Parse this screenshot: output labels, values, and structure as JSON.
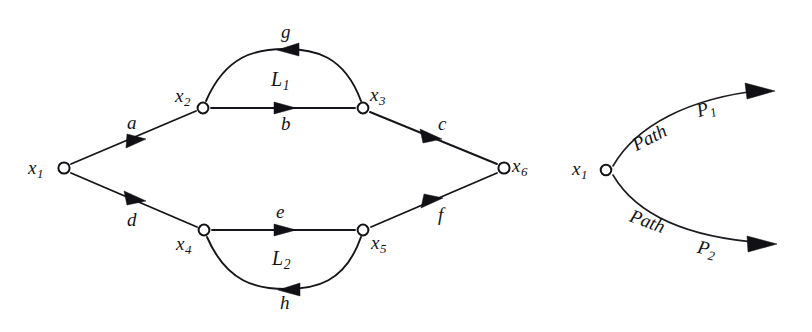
{
  "figure": {
    "background_color": "#ffffff",
    "ink_color": "#131317"
  },
  "left_graph": {
    "name": "signal-flow-graph",
    "nodes": [
      {
        "id": "x1",
        "base": "x",
        "subscript": "1",
        "cx": 64,
        "cy": 168,
        "label_side": "left"
      },
      {
        "id": "x2",
        "base": "x",
        "subscript": "2",
        "cx": 203,
        "cy": 108,
        "label_side": "upleft"
      },
      {
        "id": "x3",
        "base": "x",
        "subscript": "3",
        "cx": 363,
        "cy": 108,
        "label_side": "upright"
      },
      {
        "id": "x4",
        "base": "x",
        "subscript": "4",
        "cx": 204,
        "cy": 230,
        "label_side": "downleft"
      },
      {
        "id": "x5",
        "base": "x",
        "subscript": "5",
        "cx": 363,
        "cy": 230,
        "label_side": "downright"
      },
      {
        "id": "x6",
        "base": "x",
        "subscript": "6",
        "cx": 504,
        "cy": 168,
        "label_side": "right"
      }
    ],
    "edges": [
      {
        "id": "a",
        "label": "a",
        "from": "x1",
        "to": "x2",
        "shape": "straight",
        "direction": "forward"
      },
      {
        "id": "b",
        "label": "b",
        "from": "x2",
        "to": "x3",
        "shape": "straight",
        "direction": "forward"
      },
      {
        "id": "c",
        "label": "c",
        "from": "x3",
        "to": "x6",
        "shape": "straight",
        "direction": "forward"
      },
      {
        "id": "d",
        "label": "d",
        "from": "x1",
        "to": "x4",
        "shape": "straight",
        "direction": "forward"
      },
      {
        "id": "e",
        "label": "e",
        "from": "x4",
        "to": "x5",
        "shape": "straight",
        "direction": "forward"
      },
      {
        "id": "f",
        "label": "f",
        "from": "x5",
        "to": "x6",
        "shape": "straight",
        "direction": "forward"
      },
      {
        "id": "g",
        "label": "g",
        "from": "x3",
        "to": "x2",
        "shape": "arc-up",
        "direction": "backward"
      },
      {
        "id": "h",
        "label": "h",
        "from": "x5",
        "to": "x4",
        "shape": "arc-down",
        "direction": "backward"
      }
    ],
    "loops": [
      {
        "id": "L1",
        "base": "L",
        "subscript": "1",
        "between": [
          "x2",
          "x3"
        ],
        "edges": [
          "b",
          "g"
        ]
      },
      {
        "id": "L2",
        "base": "L",
        "subscript": "2",
        "between": [
          "x4",
          "x5"
        ],
        "edges": [
          "e",
          "h"
        ]
      }
    ]
  },
  "right_graph": {
    "name": "path-fork-graph",
    "nodes": [
      {
        "id": "x1",
        "base": "x",
        "subscript": "1",
        "cx": 606,
        "cy": 170,
        "label_side": "left"
      }
    ],
    "paths": [
      {
        "id": "P1",
        "word": "Path",
        "base": "P",
        "subscript": "1",
        "direction": "upper",
        "arrow_tip": [
          774,
          91
        ]
      },
      {
        "id": "P2",
        "word": "Path",
        "base": "P",
        "subscript": "2",
        "direction": "lower",
        "arrow_tip": [
          776,
          244
        ]
      }
    ]
  },
  "labels": {
    "a": "a",
    "b": "b",
    "c": "c",
    "d": "d",
    "e": "e",
    "f": "f",
    "g": "g",
    "h": "h",
    "x": "x",
    "L": "L",
    "P": "P",
    "path_word": "Path",
    "n1": "1",
    "n2": "2",
    "n3": "3",
    "n4": "4",
    "n5": "5",
    "n6": "6"
  }
}
